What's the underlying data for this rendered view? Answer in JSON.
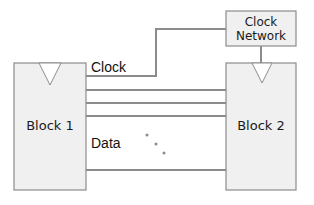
{
  "diagram": {
    "type": "block-diagram",
    "colors": {
      "block_fill": "#f0f0f0",
      "block_stroke": "#8c8c8c",
      "wire": "#8c8c8c",
      "text": "#111111",
      "background": "#ffffff"
    },
    "nodes": [
      {
        "id": "block1",
        "label": "Block 1"
      },
      {
        "id": "block2",
        "label": "Block 2"
      },
      {
        "id": "clock_network",
        "label_line1": "Clock",
        "label_line2": "Network"
      }
    ],
    "edges": [
      {
        "from": "block1",
        "to": "clock_network",
        "label": "Clock"
      },
      {
        "from": "clock_network",
        "to": "block2"
      },
      {
        "from": "block1",
        "to": "block2",
        "label": "Data",
        "count": "multiple (4 drawn with ellipsis)"
      }
    ],
    "labels": {
      "clock": "Clock",
      "data": "Data",
      "block1": "Block 1",
      "block2": "Block 2",
      "clock_network_line1": "Clock",
      "clock_network_line2": "Network"
    }
  }
}
